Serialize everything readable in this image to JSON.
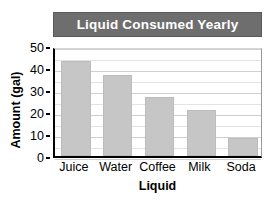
{
  "chart_data": {
    "type": "bar",
    "title": "Liquid Consumed Yearly",
    "xlabel": "Liquid",
    "ylabel": "Amount (gal)",
    "categories": [
      "Juice",
      "Water",
      "Coffee",
      "Milk",
      "Soda"
    ],
    "values": [
      43,
      37,
      27,
      21,
      8
    ],
    "ylim": [
      0,
      50
    ],
    "ytick_labels": [
      "0",
      "10",
      "20",
      "30",
      "40",
      "50"
    ],
    "ytick_values": [
      0,
      10,
      20,
      30,
      40,
      50
    ],
    "gridlines": true,
    "gridline_step": 5,
    "legend": false,
    "colors": {
      "bar_fill": "#c6c6c6",
      "bar_border": "#bcbcbc",
      "title_band": "#6e6e6e",
      "title_text": "#ffffff",
      "axis": "#000000",
      "gridline": "#cfcfcf",
      "background": "#ffffff"
    }
  }
}
